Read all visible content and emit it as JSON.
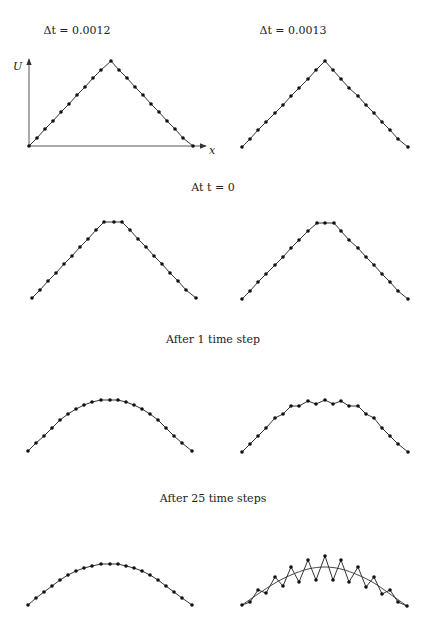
{
  "column_headers": [
    {
      "text": "Δt = 0.0012",
      "x": 77,
      "y": 24
    },
    {
      "text": "Δt = 0.0013",
      "x": 293,
      "y": 24
    }
  ],
  "row_captions": [
    {
      "text": "At t = 0",
      "x": 213,
      "y": 181
    },
    {
      "text": "After 1 time step",
      "x": 213,
      "y": 333
    },
    {
      "text": "After 25 time steps",
      "x": 213,
      "y": 492
    }
  ],
  "axes": {
    "origin": [
      29,
      146
    ],
    "y_axis_top": 59,
    "x_axis_right": 206,
    "y_label": "U",
    "x_label": "x",
    "y_label_pos": [
      13,
      70
    ],
    "x_label_pos": [
      209,
      154
    ]
  },
  "colors": {
    "line": "#333333",
    "dot": "#111111",
    "axis": "#555555"
  },
  "chart_data": [
    {
      "type": "line",
      "panel": "row1-left",
      "title": "Δt = 0.0012, initial condition",
      "xlabel": "x",
      "ylabel": "U",
      "points": [
        [
          29,
          146
        ],
        [
          37,
          138
        ],
        [
          45,
          129
        ],
        [
          53,
          121
        ],
        [
          61,
          112
        ],
        [
          69,
          104
        ],
        [
          77,
          95
        ],
        [
          85,
          87
        ],
        [
          93,
          78
        ],
        [
          101,
          70
        ],
        [
          111,
          61
        ],
        [
          119,
          70
        ],
        [
          127,
          78
        ],
        [
          135,
          87
        ],
        [
          143,
          95
        ],
        [
          151,
          104
        ],
        [
          159,
          112
        ],
        [
          167,
          121
        ],
        [
          175,
          129
        ],
        [
          183,
          138
        ],
        [
          193,
          146
        ]
      ]
    },
    {
      "type": "line",
      "panel": "row1-right",
      "title": "Δt = 0.0013, initial condition",
      "points": [
        [
          242,
          147
        ],
        [
          250,
          139
        ],
        [
          258,
          130
        ],
        [
          266,
          122
        ],
        [
          275,
          113
        ],
        [
          283,
          105
        ],
        [
          291,
          96
        ],
        [
          299,
          88
        ],
        [
          308,
          79
        ],
        [
          316,
          70
        ],
        [
          325,
          61
        ],
        [
          333,
          70
        ],
        [
          341,
          79
        ],
        [
          349,
          88
        ],
        [
          358,
          96
        ],
        [
          366,
          105
        ],
        [
          374,
          113
        ],
        [
          382,
          122
        ],
        [
          390,
          130
        ],
        [
          398,
          139
        ],
        [
          408,
          147
        ]
      ]
    },
    {
      "type": "line",
      "panel": "row2-left",
      "title": "Δt = 0.0012, after 1 time step",
      "points": [
        [
          32,
          298
        ],
        [
          40,
          290
        ],
        [
          48,
          281
        ],
        [
          56,
          273
        ],
        [
          64,
          264
        ],
        [
          72,
          256
        ],
        [
          80,
          247
        ],
        [
          88,
          239
        ],
        [
          96,
          230
        ],
        [
          104,
          222
        ],
        [
          114,
          222
        ],
        [
          122,
          222
        ],
        [
          130,
          230
        ],
        [
          138,
          239
        ],
        [
          146,
          247
        ],
        [
          154,
          256
        ],
        [
          162,
          264
        ],
        [
          170,
          273
        ],
        [
          178,
          281
        ],
        [
          186,
          290
        ],
        [
          196,
          298
        ]
      ]
    },
    {
      "type": "line",
      "panel": "row2-right",
      "title": "Δt = 0.0013, after 1 time step",
      "points": [
        [
          242,
          299
        ],
        [
          250,
          291
        ],
        [
          258,
          282
        ],
        [
          266,
          274
        ],
        [
          275,
          265
        ],
        [
          283,
          257
        ],
        [
          291,
          248
        ],
        [
          299,
          240
        ],
        [
          308,
          231
        ],
        [
          317,
          223
        ],
        [
          325,
          223
        ],
        [
          334,
          223
        ],
        [
          341,
          231
        ],
        [
          349,
          240
        ],
        [
          358,
          248
        ],
        [
          366,
          257
        ],
        [
          374,
          265
        ],
        [
          382,
          274
        ],
        [
          390,
          282
        ],
        [
          398,
          291
        ],
        [
          408,
          299
        ]
      ]
    },
    {
      "type": "line",
      "panel": "row3-left",
      "title": "Δt = 0.0012, after 25 time steps",
      "points": [
        [
          28,
          451
        ],
        [
          36,
          443
        ],
        [
          44,
          436
        ],
        [
          52,
          428
        ],
        [
          60,
          420
        ],
        [
          68,
          414
        ],
        [
          76,
          409
        ],
        [
          84,
          405
        ],
        [
          92,
          402
        ],
        [
          101,
          400
        ],
        [
          110,
          400
        ],
        [
          118,
          400
        ],
        [
          126,
          402
        ],
        [
          134,
          405
        ],
        [
          142,
          409
        ],
        [
          150,
          414
        ],
        [
          158,
          420
        ],
        [
          166,
          428
        ],
        [
          174,
          436
        ],
        [
          182,
          443
        ],
        [
          192,
          451
        ]
      ]
    },
    {
      "type": "line",
      "panel": "row3-right",
      "title": "Δt = 0.0013, after 25 time steps",
      "points": [
        [
          242,
          452
        ],
        [
          250,
          444
        ],
        [
          258,
          436
        ],
        [
          266,
          428
        ],
        [
          275,
          418
        ],
        [
          283,
          414
        ],
        [
          291,
          406
        ],
        [
          299,
          406
        ],
        [
          308,
          401
        ],
        [
          316,
          404
        ],
        [
          325,
          400
        ],
        [
          333,
          404
        ],
        [
          341,
          401
        ],
        [
          349,
          406
        ],
        [
          358,
          406
        ],
        [
          366,
          414
        ],
        [
          374,
          418
        ],
        [
          382,
          428
        ],
        [
          390,
          436
        ],
        [
          398,
          444
        ],
        [
          408,
          452
        ]
      ]
    },
    {
      "type": "line",
      "panel": "row4-left",
      "title": "Δt = 0.0012, later",
      "points": [
        [
          28,
          605
        ],
        [
          36,
          598
        ],
        [
          44,
          592
        ],
        [
          52,
          586
        ],
        [
          60,
          580
        ],
        [
          68,
          575
        ],
        [
          76,
          571
        ],
        [
          84,
          568
        ],
        [
          92,
          566
        ],
        [
          101,
          564
        ],
        [
          110,
          564
        ],
        [
          118,
          564
        ],
        [
          126,
          566
        ],
        [
          134,
          568
        ],
        [
          142,
          571
        ],
        [
          150,
          575
        ],
        [
          158,
          580
        ],
        [
          166,
          586
        ],
        [
          174,
          592
        ],
        [
          182,
          598
        ],
        [
          192,
          605
        ]
      ]
    },
    {
      "type": "line",
      "panel": "row4-right",
      "title": "Δt = 0.0013, later (oscillating)",
      "points": [
        [
          242,
          605
        ],
        [
          250,
          602
        ],
        [
          258,
          590
        ],
        [
          266,
          593
        ],
        [
          275,
          577
        ],
        [
          283,
          586
        ],
        [
          291,
          567
        ],
        [
          299,
          582
        ],
        [
          308,
          560
        ],
        [
          316,
          580
        ],
        [
          325,
          556
        ],
        [
          333,
          580
        ],
        [
          341,
          560
        ],
        [
          349,
          582
        ],
        [
          358,
          567
        ],
        [
          366,
          587
        ],
        [
          374,
          577
        ],
        [
          382,
          594
        ],
        [
          390,
          590
        ],
        [
          398,
          602
        ],
        [
          407,
          606
        ]
      ],
      "reference_curve": [
        [
          242,
          605
        ],
        [
          258,
          594
        ],
        [
          275,
          583
        ],
        [
          291,
          575
        ],
        [
          308,
          569
        ],
        [
          325,
          567
        ],
        [
          341,
          569
        ],
        [
          358,
          575
        ],
        [
          374,
          583
        ],
        [
          390,
          594
        ],
        [
          407,
          606
        ]
      ]
    }
  ]
}
